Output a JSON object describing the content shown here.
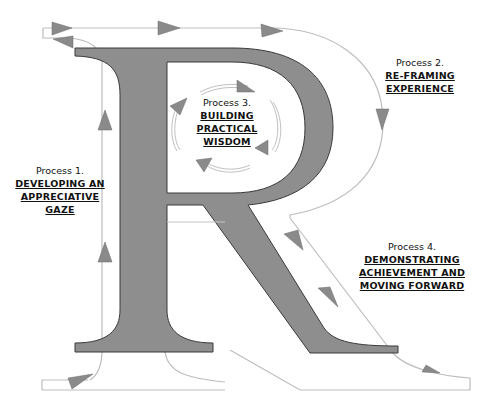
{
  "diagram": {
    "letter": "R",
    "colors": {
      "letter_fill": "#8e8e8e",
      "letter_stroke": "#3a3a3a",
      "path_stroke": "#b8b8b8",
      "arrow_fill": "#8a8a8a",
      "text": "#111111"
    },
    "processes": [
      {
        "title": "Process 1.",
        "name_lines": [
          "DEVELOPING AN",
          "APPRECIATIVE",
          "GAZE"
        ]
      },
      {
        "title": "Process 2.",
        "name_lines": [
          "RE-FRAMING",
          "EXPERIENCE"
        ]
      },
      {
        "title": "Process 3.",
        "name_lines": [
          "BUILDING",
          "PRACTICAL",
          "WISDOM"
        ]
      },
      {
        "title": "Process 4.",
        "name_lines": [
          "DEMONSTRATING",
          "ACHIEVEMENT AND",
          "MOVING FORWARD"
        ]
      }
    ]
  }
}
